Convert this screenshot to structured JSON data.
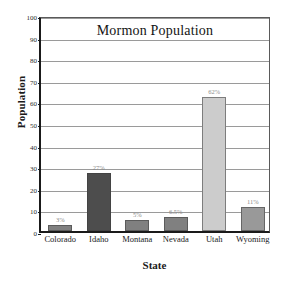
{
  "chart_data": {
    "type": "bar",
    "title": "Mormon Population",
    "xlabel": "State",
    "ylabel": "Population",
    "categories": [
      "Colorado",
      "Idaho",
      "Montana",
      "Nevada",
      "Utah",
      "Wyoming"
    ],
    "values": [
      3,
      27,
      5,
      6.5,
      62,
      11
    ],
    "data_labels": [
      "3%",
      "27%",
      "5%",
      "6.5%",
      "62%",
      "11%"
    ],
    "bar_colors": [
      "#808080",
      "#4d4d4d",
      "#808080",
      "#808080",
      "#cccccc",
      "#999999"
    ],
    "ylim": [
      0,
      100
    ],
    "yticks": [
      0,
      10,
      20,
      30,
      40,
      50,
      60,
      70,
      80,
      90,
      100
    ],
    "ytick_labels": [
      "0",
      "10",
      "20",
      "30",
      "40",
      "50",
      "60",
      "70",
      "80",
      "90",
      "100"
    ],
    "grid": true,
    "legend": false
  }
}
